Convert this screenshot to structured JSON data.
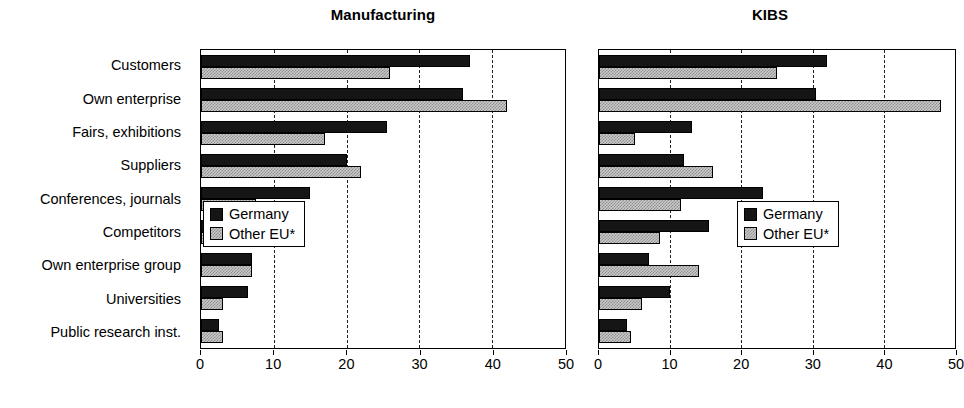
{
  "chart_data": [
    {
      "type": "bar",
      "orientation": "horizontal",
      "title": "Manufacturing",
      "xlabel": "",
      "ylabel": "",
      "xlim": [
        0,
        50
      ],
      "xticks": [
        0,
        10,
        20,
        30,
        40,
        50
      ],
      "grid": true,
      "legend_position": "middle-left-inside",
      "categories": [
        "Customers",
        "Own enterprise",
        "Fairs, exhibitions",
        "Suppliers",
        "Conferences, journals",
        "Competitors",
        "Own enterprise group",
        "Universities",
        "Public research inst."
      ],
      "series": [
        {
          "name": "Germany",
          "color": "#151515",
          "values": [
            37,
            36,
            25.5,
            20,
            15,
            14,
            7,
            6.5,
            2.5
          ]
        },
        {
          "name": "Other EU*",
          "color": "#c9c9c9",
          "values": [
            26,
            42,
            17,
            22,
            7.5,
            10.5,
            7,
            3,
            3
          ]
        }
      ]
    },
    {
      "type": "bar",
      "orientation": "horizontal",
      "title": "KIBS",
      "xlabel": "",
      "ylabel": "",
      "xlim": [
        0,
        50
      ],
      "xticks": [
        0,
        10,
        20,
        30,
        40,
        50
      ],
      "grid": true,
      "legend_position": "middle-right-inside",
      "categories": [
        "Customers",
        "Own enterprise",
        "Fairs, exhibitions",
        "Suppliers",
        "Conferences, journals",
        "Competitors",
        "Own enterprise group",
        "Universities",
        "Public research inst."
      ],
      "series": [
        {
          "name": "Germany",
          "color": "#151515",
          "values": [
            32,
            30.5,
            13,
            12,
            23,
            15.5,
            7,
            10,
            4
          ]
        },
        {
          "name": "Other EU*",
          "color": "#c9c9c9",
          "values": [
            25,
            48,
            5,
            16,
            11.5,
            8.5,
            14,
            6,
            4.5
          ]
        }
      ]
    }
  ],
  "panels": {
    "left": {
      "title": "Manufacturing"
    },
    "right": {
      "title": "KIBS"
    }
  },
  "legend": {
    "germany": "Germany",
    "other_eu": "Other EU*"
  },
  "axis": {
    "ticks": [
      "0",
      "10",
      "20",
      "30",
      "40",
      "50"
    ]
  },
  "categories": [
    "Customers",
    "Own enterprise",
    "Fairs, exhibitions",
    "Suppliers",
    "Conferences, journals",
    "Competitors",
    "Own enterprise group",
    "Universities",
    "Public research inst."
  ]
}
